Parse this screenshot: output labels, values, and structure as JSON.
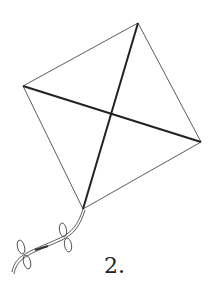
{
  "figure": {
    "label": "2.",
    "stroke_color": "#222222",
    "background": "#ffffff"
  }
}
